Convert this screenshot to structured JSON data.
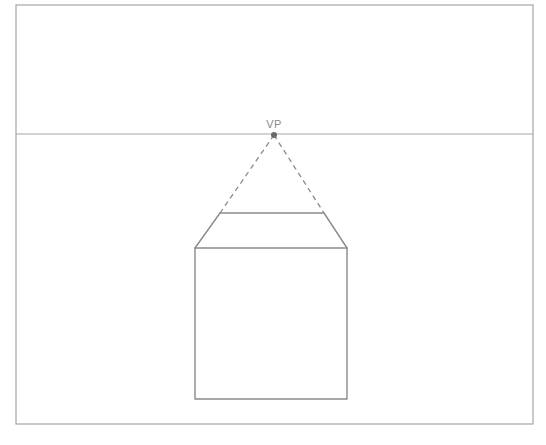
{
  "diagram": {
    "type": "one-point-perspective-drawing",
    "colors": {
      "stroke": "#8a8a8a",
      "frame": "#a6a6a6",
      "vanishing_point": "#6a6a6a",
      "background": "#ffffff"
    },
    "frame": {
      "x1": 16,
      "y1": 5,
      "x2": 533,
      "y2": 424
    },
    "horizon_line": {
      "y": 134,
      "x1": 16,
      "x2": 533
    },
    "vanishing_point": {
      "label": "VP",
      "x": 274,
      "y": 135
    },
    "box": {
      "front_face": {
        "x1": 195,
        "y1": 248,
        "x2": 347,
        "y2": 399
      },
      "top_back_edge": {
        "x1": 220,
        "y1": 213,
        "x2": 324,
        "y2": 213
      }
    },
    "construction_lines": [
      {
        "from": "VP",
        "to": "top-back-left",
        "style": "dashed"
      },
      {
        "from": "VP",
        "to": "top-back-right",
        "style": "dashed"
      }
    ]
  }
}
